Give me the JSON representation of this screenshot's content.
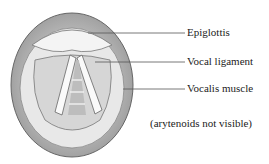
{
  "figure": {
    "labels": [
      {
        "text": "Epiglottis",
        "x": 187,
        "y": 28
      },
      {
        "text": "Vocal ligament",
        "x": 187,
        "y": 56
      },
      {
        "text": "Vocalis muscle",
        "x": 187,
        "y": 83
      }
    ],
    "caption": "(arytenoids not visible)",
    "colors": {
      "ink": "#222222",
      "line": "#555555",
      "tissue": "#d8d8d8"
    }
  }
}
